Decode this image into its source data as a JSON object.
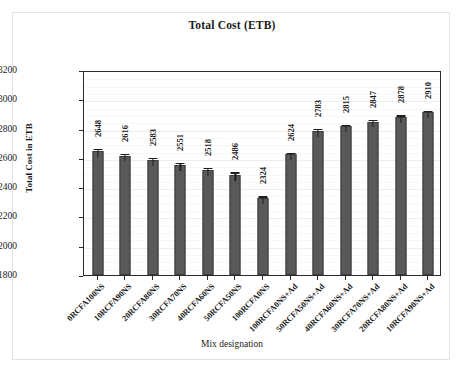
{
  "chart_data": {
    "type": "bar",
    "title": "Total Cost (ETB)",
    "xlabel": "Mix designation",
    "ylabel": "Total Cost in ETB",
    "ylim": [
      1800,
      3200
    ],
    "ytick_step": 200,
    "yticks": [
      1800,
      2000,
      2200,
      2400,
      2600,
      2800,
      3000,
      3200
    ],
    "grid": true,
    "legend": null,
    "categories": [
      "0RCFA100NS",
      "10RCFA90NS",
      "20RCFA80NS",
      "30RCFA70NS",
      "40RCFA60NS",
      "50RCFA50NS",
      "100RCFA0NS",
      "100RCFA0NS+Ad",
      "50RCFA50NS+Ad",
      "40RCFA60NS+Ad",
      "30RCFA70NS+Ad",
      "20RCFA80NS+Ad",
      "10RCFA90NS+Ad"
    ],
    "values": [
      2648,
      2616,
      2583,
      2551,
      2518,
      2486,
      2324,
      2624,
      2783,
      2815,
      2847,
      2878,
      2910
    ],
    "error_bars": [
      28,
      26,
      28,
      26,
      26,
      28,
      26,
      26,
      26,
      26,
      26,
      26,
      26
    ],
    "bar_color": "#595959",
    "bar_edge_color": "#3d3d3d",
    "axis_color": "#2b2b2b",
    "grid_color": "#ededed"
  }
}
